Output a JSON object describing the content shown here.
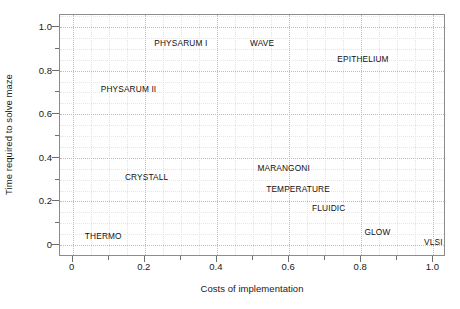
{
  "chart_data": {
    "type": "scatter",
    "title": "",
    "xlabel": "Costs of implementation",
    "ylabel": "Time required to solve maze",
    "xlim": [
      -0.035,
      1.035
    ],
    "ylim": [
      -0.055,
      1.055
    ],
    "xticks": [
      "0",
      "0.2",
      "0.4",
      "0.6",
      "0.8",
      "1.0"
    ],
    "xtick_values": [
      0,
      0.2,
      0.4,
      0.6,
      0.8,
      1.0
    ],
    "yticks": [
      "0",
      "0.2",
      "0.4",
      "0.6",
      "0.8",
      "1.0"
    ],
    "ytick_values": [
      0,
      0.2,
      0.4,
      0.6,
      0.8,
      1.0
    ],
    "grid": true,
    "legend": false,
    "marker_style": "text-only",
    "points": [
      {
        "label": "PHYSARUM I",
        "x": 0.3,
        "y": 0.925
      },
      {
        "label": "WAVE",
        "x": 0.525,
        "y": 0.925
      },
      {
        "label": "EPITHELIUM",
        "x": 0.805,
        "y": 0.855
      },
      {
        "label": "PHYSARUM II",
        "x": 0.155,
        "y": 0.715
      },
      {
        "label": "MARANGONI",
        "x": 0.585,
        "y": 0.355
      },
      {
        "label": "CRYSTALL",
        "x": 0.205,
        "y": 0.31
      },
      {
        "label": "TEMPERATURE",
        "x": 0.625,
        "y": 0.255
      },
      {
        "label": "FLUIDIC",
        "x": 0.71,
        "y": 0.17
      },
      {
        "label": "THERMO",
        "x": 0.085,
        "y": 0.04
      },
      {
        "label": "GLOW",
        "x": 0.845,
        "y": 0.06
      },
      {
        "label": "VLSI",
        "x": 1.0,
        "y": 0.013
      }
    ]
  },
  "colors": {
    "frame": "#8c8c8c",
    "grid_major": "#bdbdbd",
    "grid_minor": "#e6e6e6",
    "text": "#1a1a1a",
    "background": "#ffffff"
  }
}
